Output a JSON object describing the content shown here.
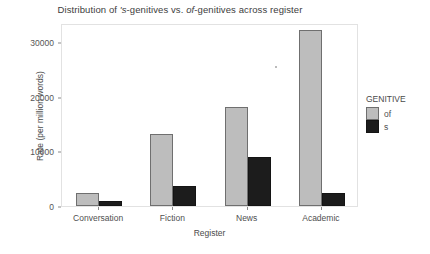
{
  "chart_data": {
    "type": "bar",
    "title": "Distribution of 's-genitives vs. of-genitives across register",
    "title_parts": {
      "lead": "Distribution of ",
      "italic1": "'s",
      "mid1": "-genitives vs. ",
      "italic2": "of",
      "tail": "-genitives across register"
    },
    "xlabel": "Register",
    "ylabel": "Rate (per million words)",
    "categories": [
      "Conversation",
      "Fiction",
      "News",
      "Academic"
    ],
    "ylim": [
      0,
      33500
    ],
    "yticks": [
      0,
      10000,
      20000,
      30000
    ],
    "ytick_labels": [
      "0",
      "10000",
      "20000",
      "30000"
    ],
    "grid": false,
    "legend": {
      "title": "GENITIVE",
      "position": "right",
      "entries": [
        {
          "label": "of",
          "color": "#bdbdbd"
        },
        {
          "label": "s",
          "color": "#1c1c1c"
        }
      ]
    },
    "series": [
      {
        "name": "of",
        "color": "#bdbdbd",
        "values": [
          2300,
          13100,
          18200,
          32200
        ]
      },
      {
        "name": "s",
        "color": "#1c1c1c",
        "values": [
          900,
          3600,
          9000,
          2300
        ]
      }
    ]
  },
  "colors": {
    "background": "#ffffff",
    "panel_border": "#e2e2e2",
    "bar_of": "#bdbdbd",
    "bar_s": "#1c1c1c",
    "bar_outline": "#6e6e6e",
    "text": "#4d4d4d"
  }
}
